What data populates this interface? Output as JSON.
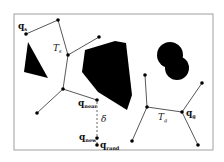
{
  "diagram": {
    "frame": {
      "x": 14,
      "y": 14,
      "w": 199,
      "h": 136,
      "stroke": "#999999"
    },
    "labels": {
      "q_s": "q",
      "q_s_sub": "s",
      "T_s": "T",
      "T_s_sub": "s",
      "q_near": "q",
      "q_near_sub": "near",
      "delta": "δ",
      "q_new": "q",
      "q_new_sub": "new",
      "q_rand": "q",
      "q_rand_sub": "rand",
      "T_g": "T",
      "T_g_sub": "g",
      "q_g": "q",
      "q_g_sub": "g"
    },
    "colors": {
      "obstacle": "#000000",
      "edge": "#444444",
      "node": "#000000",
      "dashed": "#555555"
    }
  }
}
